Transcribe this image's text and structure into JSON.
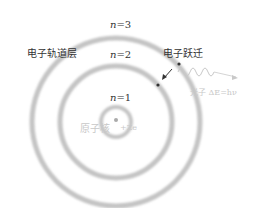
{
  "diagram": {
    "type": "bohr-atom-model",
    "orbits": [
      {
        "n_label": "n=1",
        "n_var": "n",
        "n_value": "=1"
      },
      {
        "n_label": "n=2",
        "n_var": "n",
        "n_value": "=2"
      },
      {
        "n_label": "n=3",
        "n_var": "n",
        "n_value": "=3"
      }
    ],
    "labels": {
      "electron_shell": "电子轨道层",
      "electron_transition": "电子跃迁",
      "nucleus": "原子核",
      "nucleus_charge": "+Ze",
      "photon": "光子 ΔE=hν"
    },
    "colors": {
      "ring": "#c9c9c9",
      "text": "#333333",
      "faint_text": "#c8c8c8",
      "electron": "#333333"
    }
  }
}
